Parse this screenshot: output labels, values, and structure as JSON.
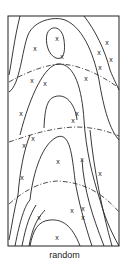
{
  "figure": {
    "caption": "random",
    "box": {
      "x": 8,
      "y": 16,
      "width": 111,
      "height": 230
    },
    "line_color": "#222222",
    "markers": [
      {
        "x": 57,
        "y": 38
      },
      {
        "x": 35,
        "y": 48
      },
      {
        "x": 107,
        "y": 42
      },
      {
        "x": 99,
        "y": 52
      },
      {
        "x": 62,
        "y": 56
      },
      {
        "x": 111,
        "y": 59
      },
      {
        "x": 100,
        "y": 67
      },
      {
        "x": 32,
        "y": 80
      },
      {
        "x": 45,
        "y": 83
      },
      {
        "x": 86,
        "y": 78
      },
      {
        "x": 21,
        "y": 113
      },
      {
        "x": 77,
        "y": 113
      },
      {
        "x": 73,
        "y": 120
      },
      {
        "x": 24,
        "y": 145
      },
      {
        "x": 33,
        "y": 138
      },
      {
        "x": 58,
        "y": 161
      },
      {
        "x": 82,
        "y": 159
      },
      {
        "x": 22,
        "y": 177
      },
      {
        "x": 100,
        "y": 173
      },
      {
        "x": 72,
        "y": 210
      },
      {
        "x": 83,
        "y": 208
      },
      {
        "x": 83,
        "y": 217
      },
      {
        "x": 39,
        "y": 217
      },
      {
        "x": 57,
        "y": 237
      }
    ]
  }
}
